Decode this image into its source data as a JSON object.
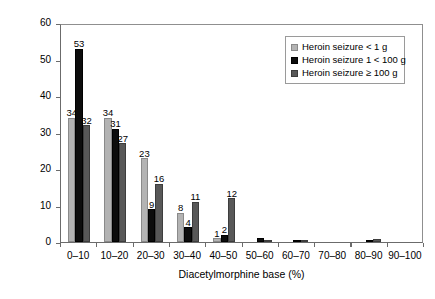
{
  "chart_data": {
    "type": "bar",
    "title": "",
    "xlabel": "Diacetylmorphine base (%)",
    "ylabel": "Purity of dose (%)",
    "ylim": [
      0,
      60
    ],
    "yticks": [
      0,
      10,
      20,
      30,
      40,
      50,
      60
    ],
    "grid": false,
    "legend_position": "top-right",
    "categories": [
      "0–10",
      "10–20",
      "20–30",
      "30–40",
      "40–50",
      "50–60",
      "60–70",
      "70–80",
      "80–90",
      "90–100"
    ],
    "series": [
      {
        "name": "Heroin seizure < 1 g",
        "color": "#b3b3b3",
        "values": [
          34,
          34,
          23,
          8,
          1,
          0,
          0,
          0,
          0,
          0
        ],
        "labels": [
          "34",
          "34",
          "23",
          "8",
          "1",
          "",
          "",
          "",
          "",
          ""
        ]
      },
      {
        "name": "Heroin seizure 1 < 100 g",
        "color": "#0d0d0d",
        "values": [
          53,
          31,
          9,
          4,
          2,
          1,
          0.3,
          0,
          0.6,
          0
        ],
        "labels": [
          "53",
          "31",
          "9",
          "4",
          "2",
          "",
          "",
          "",
          "",
          ""
        ]
      },
      {
        "name": "Heroin seizure ≥ 100 g",
        "color": "#585858",
        "values": [
          32,
          27,
          16,
          11,
          12,
          0.4,
          0.3,
          0,
          0.9,
          0
        ],
        "labels": [
          "32",
          "27",
          "16",
          "11",
          "12",
          "",
          "",
          "",
          "",
          ""
        ]
      }
    ]
  }
}
